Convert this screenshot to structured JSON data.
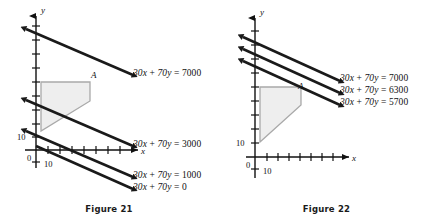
{
  "figures": [
    {
      "id": "figure-21",
      "caption": "Figure 21",
      "axes": {
        "x_name": "x",
        "y_name": "y",
        "origin_label": "0",
        "x_tick_label": "10",
        "y_tick_label": "10"
      },
      "region": {
        "vertex_label": "A",
        "fill_color": "#eeeeee",
        "stroke_color": "#a9a9a9"
      },
      "line_color": "#1a1a1a",
      "lines": [
        {
          "label": "30x + 70y = 7000",
          "lhs": "30x + 70y",
          "rhs": "7000",
          "value": 7000
        },
        {
          "label": "30x + 70y = 3000",
          "lhs": "30x + 70y",
          "rhs": "3000",
          "value": 3000
        },
        {
          "label": "30x + 70y = 1000",
          "lhs": "30x + 70y",
          "rhs": "1000",
          "value": 1000
        },
        {
          "label": "30x + 70y = 0",
          "lhs": "30x + 70y",
          "rhs": "0",
          "value": 0
        }
      ]
    },
    {
      "id": "figure-22",
      "caption": "Figure 22",
      "axes": {
        "x_name": "x",
        "y_name": "y",
        "origin_label": "0",
        "x_tick_label": "10",
        "y_tick_label": "10"
      },
      "region": {
        "vertex_label": "A",
        "fill_color": "#eeeeee",
        "stroke_color": "#a9a9a9"
      },
      "line_color": "#1a1a1a",
      "lines": [
        {
          "label": "30x + 70y = 7000",
          "lhs": "30x + 70y",
          "rhs": "7000",
          "value": 7000
        },
        {
          "label": "30x + 70y = 6300",
          "lhs": "30x + 70y",
          "rhs": "6300",
          "value": 6300
        },
        {
          "label": "30x + 70y = 5700",
          "lhs": "30x + 70y",
          "rhs": "5700",
          "value": 5700
        }
      ]
    }
  ]
}
